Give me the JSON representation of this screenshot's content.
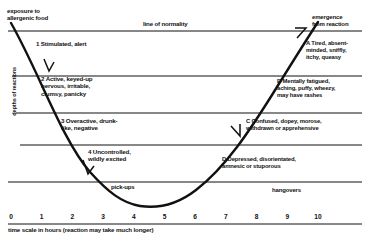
{
  "diagram": {
    "annotations": {
      "exposure": "exposure to\nallergenic food",
      "emergence": "emergence\nfrom reaction",
      "line_of_normality": "line of normality",
      "pickups": "pick-ups",
      "hangovers": "hangovers"
    },
    "axes": {
      "y_label": "depths of reactions",
      "x_label": "time scale in hours (reaction may take much longer)",
      "x_ticks": [
        "0",
        "1",
        "2",
        "3",
        "4",
        "5",
        "6",
        "7",
        "8",
        "9",
        "10"
      ]
    },
    "descent_bands": [
      {
        "id": "1",
        "text": "1  Stimulated, alert"
      },
      {
        "id": "2",
        "text": "2  Active, keyed-up\nnervous, irritable,\nclumsy, panicky"
      },
      {
        "id": "3",
        "text": "3   Overactive, drunk-\nlike, negative"
      },
      {
        "id": "4",
        "text": "4  Uncontrolled,\nwildly excited"
      }
    ],
    "recovery_bands": [
      {
        "id": "A",
        "text": "A  Tired, absent-\nminded, sniffly,\nitchy, queasy"
      },
      {
        "id": "B",
        "text": "B  Mentally fatigued,\naching, puffy, wheezy,\nmay have rashes"
      },
      {
        "id": "C",
        "text": "C  Confused, dopey, morose,\nwithdrawn or apprehensive"
      },
      {
        "id": "D",
        "text": "D  Depressed, disorientated,\namnesic or stuporous"
      }
    ]
  },
  "chart_data": {
    "type": "line",
    "xlabel": "time scale in hours (reaction may take much longer)",
    "ylabel": "depths of reactions",
    "xlim": [
      0,
      10
    ],
    "ylim": [
      -5,
      0
    ],
    "grid": true,
    "legend_position": "none",
    "x": [
      0,
      0.5,
      1,
      1.5,
      2,
      2.5,
      3,
      3.5,
      4,
      4.5,
      5,
      5.5,
      6,
      6.5,
      7,
      7.5,
      8,
      8.5,
      9,
      9.5,
      10
    ],
    "values": [
      0,
      -0.9,
      -1.7,
      -2.4,
      -3.0,
      -3.6,
      -4.2,
      -4.6,
      -4.7,
      -4.6,
      -4.3,
      -3.9,
      -3.4,
      -2.9,
      -2.4,
      -1.9,
      -1.4,
      -1.0,
      -0.6,
      -0.25,
      0
    ],
    "gridline_levels": [
      0,
      -1,
      -2,
      -3,
      -4
    ],
    "band_boundaries": [
      {
        "level": 0,
        "label": "line of normality"
      },
      {
        "level": -1,
        "label": ""
      },
      {
        "level": -2,
        "label": ""
      },
      {
        "level": -3,
        "label": ""
      },
      {
        "level": -4,
        "label": ""
      }
    ],
    "annotations": [
      {
        "x": 0,
        "y": 0,
        "text": "exposure to allergenic food"
      },
      {
        "x": 10,
        "y": 0,
        "text": "emergence from reaction"
      },
      {
        "x": 3.2,
        "y": -4.3,
        "text": "pick-ups"
      },
      {
        "x": 8.0,
        "y": -4.3,
        "text": "hangovers"
      }
    ]
  }
}
